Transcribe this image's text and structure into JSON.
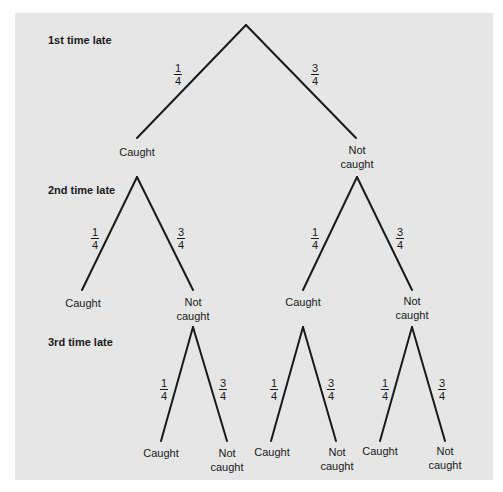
{
  "levels": [
    {
      "label": "1st time late"
    },
    {
      "label": "2nd time late"
    },
    {
      "label": "3rd time late"
    }
  ],
  "outcomes": {
    "caught": "Caught",
    "not_caught_1": "Not",
    "not_caught_2": "caught"
  },
  "probabilities": {
    "caught": {
      "num": "1",
      "den": "4"
    },
    "not_caught": {
      "num": "3",
      "den": "4"
    }
  },
  "colors": {
    "panel": "#e6e6e6",
    "line": "#1a1a1a"
  }
}
